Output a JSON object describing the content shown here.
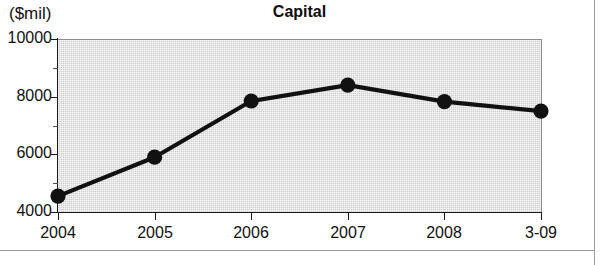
{
  "figure": {
    "units_label": "($mil)",
    "title": "Capital"
  },
  "chart_data": {
    "type": "line",
    "title": "Capital",
    "xlabel": "",
    "ylabel": "($mil)",
    "categories": [
      "2004",
      "2005",
      "2006",
      "2007",
      "2008",
      "3-09"
    ],
    "values": [
      4550,
      5900,
      7850,
      8400,
      7830,
      7500
    ],
    "series": [
      {
        "name": "Capital",
        "values": [
          4550,
          5900,
          7850,
          8400,
          7830,
          7500
        ]
      }
    ],
    "ylim": [
      4000,
      10000
    ],
    "ytick_labels": [
      "10000",
      "8000",
      "6000",
      "4000"
    ],
    "ytick_values": [
      10000,
      8000,
      6000,
      4000
    ],
    "yminor_tick_values": [
      9000,
      7000,
      5000
    ],
    "grid": false,
    "legend": "none",
    "marker": "filled-circle",
    "line_color": "#111111",
    "marker_color": "#111111",
    "plot_background_color": "#d6d6d6"
  }
}
